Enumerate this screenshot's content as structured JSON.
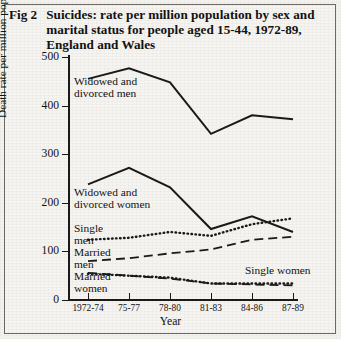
{
  "figure": {
    "number": "Fig 2",
    "title": "Suicides: rate per million population by sex and marital status for people aged 15-44, 1972-89, England and Wales"
  },
  "axes": {
    "y_title": "Death rate per million population",
    "x_title": "Year",
    "y_ticks": [
      "0",
      "100",
      "200",
      "300",
      "400",
      "500"
    ],
    "x_ticks": [
      "1972-74",
      "75-77",
      "78-80",
      "81-83",
      "84-86",
      "87-89"
    ]
  },
  "series_labels": {
    "widowed_divorced_men": "Widowed and\ndivorced men",
    "widowed_divorced_women": "Widowed and\ndivorced women",
    "single_men": "Single\nmen",
    "married_men": "Married\nmen",
    "married_women": "Married\nwomen",
    "single_women": "Single women"
  },
  "chart_data": {
    "type": "line",
    "title": "Suicides: rate per million population by sex and marital status for people aged 15-44, 1972-89, England and Wales",
    "xlabel": "Year",
    "ylabel": "Death rate per million population",
    "categories": [
      "1972-74",
      "75-77",
      "78-80",
      "81-83",
      "84-86",
      "87-89"
    ],
    "ylim": [
      0,
      500
    ],
    "ytick_step": 100,
    "grid": false,
    "legend": "inline-labels",
    "series": [
      {
        "name": "Widowed and divorced men",
        "style": "solid",
        "values": [
          455,
          477,
          448,
          342,
          380,
          372
        ]
      },
      {
        "name": "Widowed and divorced women",
        "style": "solid",
        "values": [
          238,
          272,
          232,
          146,
          172,
          140
        ]
      },
      {
        "name": "Single men",
        "style": "dotted",
        "values": [
          124,
          128,
          140,
          132,
          156,
          168
        ]
      },
      {
        "name": "Married men",
        "style": "dashed",
        "values": [
          80,
          86,
          96,
          104,
          124,
          130
        ]
      },
      {
        "name": "Married women",
        "style": "dashed",
        "values": [
          56,
          50,
          44,
          34,
          32,
          30
        ]
      },
      {
        "name": "Single women",
        "style": "dotted",
        "values": [
          54,
          50,
          46,
          34,
          34,
          34
        ]
      }
    ]
  },
  "colors": {
    "ink": "#1a1a1a",
    "paper": "#f6f4f0",
    "border": "#6e6a62"
  }
}
